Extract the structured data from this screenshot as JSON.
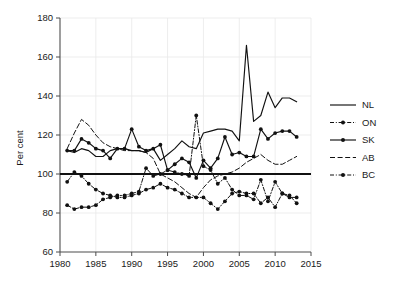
{
  "chart_data": {
    "type": "line",
    "title": "",
    "xlabel": "",
    "ylabel": "Per cent",
    "xlim": [
      1980,
      2015
    ],
    "ylim": [
      60,
      180
    ],
    "xticks": [
      1980,
      1985,
      1990,
      1995,
      2000,
      2005,
      2010,
      2015
    ],
    "yticks": [
      60,
      80,
      100,
      120,
      140,
      160,
      180
    ],
    "grid": true,
    "legend_position": "right",
    "reference_line": {
      "name": "canada-reference",
      "value": 100,
      "style": "solid-thick"
    },
    "x": [
      1981,
      1982,
      1983,
      1984,
      1985,
      1986,
      1987,
      1988,
      1989,
      1990,
      1991,
      1992,
      1993,
      1994,
      1995,
      1996,
      1997,
      1998,
      1999,
      2000,
      2001,
      2002,
      2003,
      2004,
      2005,
      2006,
      2007,
      2008,
      2009,
      2010,
      2011,
      2012,
      2013
    ],
    "series": [
      {
        "name": "NL",
        "style": "solid",
        "marker": "none",
        "values": [
          112,
          111,
          113,
          112,
          109,
          109,
          112,
          113,
          113,
          112,
          112,
          111,
          113,
          107,
          110,
          113,
          117,
          114,
          113,
          121,
          122,
          123,
          123,
          122,
          117,
          166,
          127,
          130,
          142,
          134,
          139,
          139,
          137
        ]
      },
      {
        "name": "ON",
        "style": "dash-dot",
        "marker": "circle",
        "values": [
          96,
          101,
          99,
          95,
          92,
          90,
          89,
          88,
          88,
          89,
          90,
          92,
          93,
          95,
          93,
          92,
          90,
          88,
          88,
          88,
          85,
          82,
          86,
          90,
          91,
          90,
          90,
          85,
          88,
          83,
          90,
          89,
          85
        ]
      },
      {
        "name": "SK",
        "style": "solid",
        "marker": "circle",
        "values": [
          112,
          112,
          118,
          116,
          113,
          112,
          108,
          113,
          113,
          123,
          114,
          112,
          113,
          115,
          102,
          105,
          108,
          106,
          98,
          107,
          103,
          108,
          119,
          110,
          111,
          109,
          109,
          123,
          118,
          121,
          122,
          122,
          119
        ]
      },
      {
        "name": "AB",
        "style": "dashed",
        "marker": "none",
        "values": [
          113,
          121,
          128,
          125,
          120,
          116,
          114,
          113,
          112,
          112,
          112,
          111,
          108,
          100,
          98,
          96,
          93,
          90,
          88,
          93,
          97,
          99,
          100,
          101,
          103,
          106,
          108,
          110,
          107,
          105,
          105,
          107,
          109
        ]
      },
      {
        "name": "BC",
        "style": "dash-dot",
        "marker": "circle",
        "values": [
          84,
          82,
          83,
          83,
          84,
          87,
          88,
          89,
          89,
          90,
          91,
          103,
          99,
          100,
          102,
          101,
          100,
          99,
          130,
          104,
          102,
          95,
          98,
          92,
          89,
          89,
          87,
          97,
          86,
          96,
          90,
          88,
          88
        ]
      }
    ]
  },
  "legend": {
    "entries": [
      {
        "label": "NL",
        "style": "solid",
        "marker": "none"
      },
      {
        "label": "ON",
        "style": "dash-dot",
        "marker": "circle"
      },
      {
        "label": "SK",
        "style": "solid",
        "marker": "circle"
      },
      {
        "label": "AB",
        "style": "dashed",
        "marker": "none"
      },
      {
        "label": "BC",
        "style": "dash-dot",
        "marker": "circle"
      }
    ]
  },
  "colors": {
    "ink": "#111111",
    "grid": "#e8e8e8",
    "axis": "#4d4d4d",
    "background": "#ffffff"
  }
}
